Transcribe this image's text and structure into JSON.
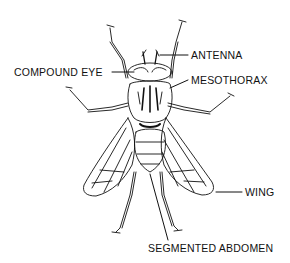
{
  "diagram": {
    "labels": {
      "antenna": "ANTENNA",
      "compound_eye": "COMPOUND EYE",
      "mesothorax": "MESOTHORAX",
      "wing": "WING",
      "segmented_abdomen": "SEGMENTED ABDOMEN"
    },
    "colors": {
      "line": "#111111",
      "background": "#ffffff"
    }
  }
}
